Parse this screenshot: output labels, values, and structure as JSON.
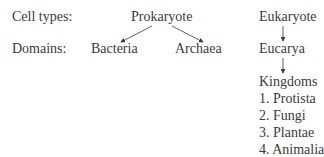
{
  "labels": {
    "cell_types": "Cell types:",
    "domains": "Domains:"
  },
  "nodes": {
    "prokaryote": "Prokaryote",
    "eukaryote": "Eukaryote",
    "bacteria": "Bacteria",
    "archaea": "Archaea",
    "eucarya": "Eucarya",
    "kingdoms": "Kingdoms"
  },
  "kingdoms_list": [
    "1. Protista",
    "2. Fungi",
    "3. Plantae",
    "4. Animalia"
  ],
  "edges": [
    {
      "from": "Prokaryote",
      "to": "Bacteria"
    },
    {
      "from": "Prokaryote",
      "to": "Archaea"
    },
    {
      "from": "Eukaryote",
      "to": "Eucarya"
    },
    {
      "from": "Eucarya",
      "to": "Kingdoms"
    }
  ]
}
